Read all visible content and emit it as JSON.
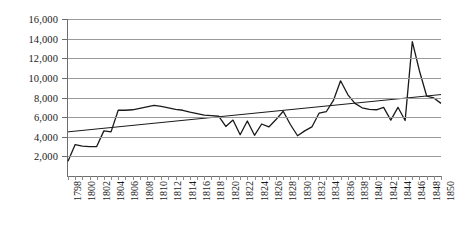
{
  "chart_data": {
    "type": "line",
    "title": "",
    "xlabel": "",
    "ylabel": "",
    "ylim": [
      0,
      16000
    ],
    "xlim": [
      1798,
      1850
    ],
    "grid": true,
    "legend": false,
    "y_ticks": [
      16000,
      14000,
      12000,
      10000,
      8000,
      6000,
      4000,
      2000
    ],
    "y_tick_labels": [
      "16,000",
      "14,000",
      "12,000",
      "10,000",
      "8,000",
      "6,000",
      "4,000",
      "2,000"
    ],
    "x_tick_labels": [
      "1798",
      "1800",
      "1802",
      "1804",
      "1806",
      "1808",
      "1810",
      "1812",
      "1814",
      "1816",
      "1818",
      "1820",
      "1822",
      "1824",
      "1826",
      "1828",
      "1830",
      "1832",
      "1834",
      "1836",
      "1838",
      "1840",
      "1842",
      "1844",
      "1846",
      "1848",
      "1850"
    ],
    "x": [
      1798,
      1799,
      1800,
      1801,
      1802,
      1803,
      1804,
      1805,
      1806,
      1807,
      1808,
      1809,
      1810,
      1811,
      1812,
      1813,
      1814,
      1815,
      1816,
      1817,
      1818,
      1819,
      1820,
      1821,
      1822,
      1823,
      1824,
      1825,
      1826,
      1827,
      1828,
      1829,
      1830,
      1831,
      1832,
      1833,
      1834,
      1835,
      1836,
      1837,
      1838,
      1839,
      1840,
      1841,
      1842,
      1843,
      1844,
      1845,
      1846,
      1847,
      1848,
      1849,
      1850
    ],
    "series": [
      {
        "name": "value",
        "color": "#1a1a1a",
        "values": [
          1500,
          3200,
          3050,
          3000,
          3000,
          4600,
          4500,
          6700,
          6700,
          6750,
          6900,
          7050,
          7200,
          7100,
          6950,
          6800,
          6700,
          6500,
          6350,
          6200,
          6150,
          6100,
          5050,
          5700,
          4200,
          5600,
          4150,
          5300,
          5000,
          5750,
          6600,
          5250,
          4100,
          4600,
          5000,
          6400,
          6550,
          7700,
          9700,
          8300,
          7400,
          6950,
          6800,
          6750,
          7000,
          5700,
          7000,
          5650,
          13700,
          10700,
          8150,
          7950,
          7400
        ]
      }
    ],
    "trendline": {
      "name": "linear-trend",
      "color": "#1a1a1a",
      "start_value": 4500,
      "end_value": 8300
    }
  }
}
